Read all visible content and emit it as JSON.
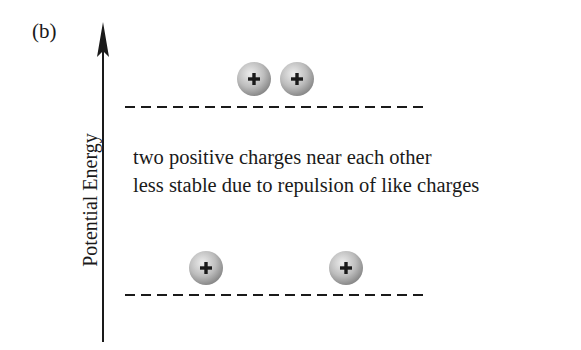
{
  "figure": {
    "panel_label": "(b)",
    "axis": {
      "label": "Potential Energy",
      "direction": "up"
    },
    "description": {
      "line1": "two positive charges near each other",
      "line2": "less stable due to repulsion of like charges"
    },
    "levels": [
      {
        "name": "higher-energy-level",
        "state": "charges close together",
        "charges": [
          {
            "sign": "+"
          },
          {
            "sign": "+"
          }
        ]
      },
      {
        "name": "lower-energy-level",
        "state": "charges far apart",
        "charges": [
          {
            "sign": "+"
          },
          {
            "sign": "+"
          }
        ]
      }
    ],
    "colors": {
      "ink": "#1a1a1a",
      "charge_fill_light": "#e6e6e6",
      "charge_fill_dark": "#8f8f8f",
      "background": "#ffffff"
    }
  }
}
